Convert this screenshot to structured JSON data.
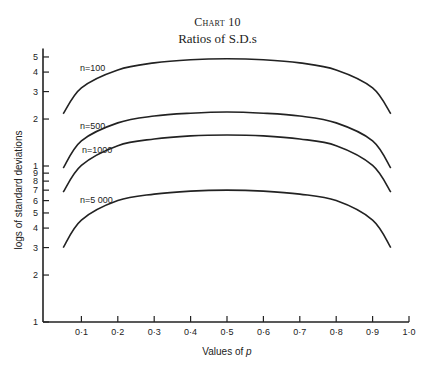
{
  "header": {
    "chart_number": "Chart 10",
    "title": "Ratios of S.D.s"
  },
  "chart_data": {
    "type": "line",
    "title": "Ratios of S.D.s",
    "subtitle": "Chart 10",
    "xlabel": "Values of p",
    "ylabel": "logs of standard deviations",
    "x_scale": "linear",
    "y_scale": "log",
    "xlim": [
      0,
      1.0
    ],
    "ylim": [
      0.1,
      5.5
    ],
    "x_ticks": [
      0.1,
      0.2,
      0.3,
      0.4,
      0.5,
      0.6,
      0.7,
      0.8,
      0.9,
      1.0
    ],
    "x_tick_labels": [
      "0·1",
      "0·2",
      "0·3",
      "0·4",
      "0·5",
      "0·6",
      "0·7",
      "0·8",
      "0·9",
      "1·0"
    ],
    "y_ticks": [
      0.1,
      0.2,
      0.3,
      0.4,
      0.5,
      0.6,
      0.7,
      0.8,
      0.9,
      1,
      2,
      3,
      4,
      5
    ],
    "y_tick_labels": [
      "1",
      "2",
      "3",
      "4",
      "5",
      "6",
      "7",
      "8",
      "9",
      "1",
      "2",
      "3",
      "4",
      "5"
    ],
    "grid": false,
    "legend": "inline labels at left of curves",
    "x": [
      0.05,
      0.1,
      0.2,
      0.3,
      0.4,
      0.5,
      0.6,
      0.7,
      0.8,
      0.9,
      0.95
    ],
    "series": [
      {
        "name": "n=100",
        "values": [
          2.16,
          3.17,
          4.13,
          4.58,
          4.8,
          4.87,
          4.8,
          4.58,
          4.13,
          3.17,
          2.16
        ]
      },
      {
        "name": "n=500",
        "values": [
          0.97,
          1.45,
          1.89,
          2.09,
          2.18,
          2.22,
          2.18,
          2.09,
          1.89,
          1.45,
          0.97
        ]
      },
      {
        "name": "n=1000",
        "values": [
          0.68,
          1.01,
          1.35,
          1.49,
          1.56,
          1.58,
          1.56,
          1.49,
          1.35,
          1.01,
          0.68
        ]
      },
      {
        "name": "n=5 000",
        "values": [
          0.3,
          0.45,
          0.6,
          0.66,
          0.69,
          0.7,
          0.69,
          0.66,
          0.6,
          0.45,
          0.3
        ]
      }
    ]
  },
  "colors": {
    "ink": "#222222",
    "background": "#ffffff"
  }
}
